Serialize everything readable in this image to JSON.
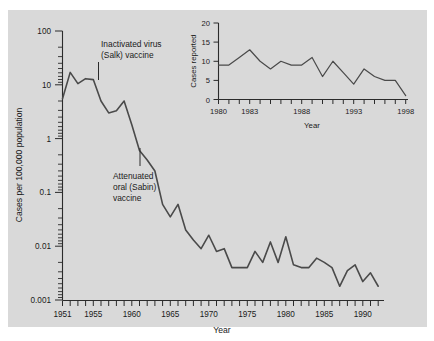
{
  "figure": {
    "background_color": "#ffffff",
    "panel_color": "#d9d9d9",
    "line_color": "#4a4a4a",
    "axis_color": "#2b2b2b"
  },
  "chart_data": {
    "type": "line",
    "title": "",
    "xlabel": "Year",
    "ylabel": "Cases per 100,000 population",
    "yscale": "log",
    "ylim": [
      0.001,
      100
    ],
    "xlim": [
      1951,
      1992
    ],
    "grid": false,
    "legend": "none",
    "ytick_labels": [
      "100",
      "10",
      "1",
      "0.1",
      "0.01",
      "0.001"
    ],
    "ytick_values": [
      100,
      10,
      1,
      0.1,
      0.01,
      0.001
    ],
    "xtick_labels": [
      "1951",
      "1955",
      "1960",
      "1965",
      "1970",
      "1975",
      "1980",
      "1985",
      "1990"
    ],
    "xtick_values": [
      1951,
      1955,
      1960,
      1965,
      1970,
      1975,
      1980,
      1985,
      1990
    ],
    "x": [
      1951,
      1952,
      1953,
      1954,
      1955,
      1956,
      1957,
      1958,
      1959,
      1960,
      1961,
      1962,
      1963,
      1964,
      1965,
      1966,
      1967,
      1968,
      1969,
      1970,
      1971,
      1972,
      1973,
      1974,
      1975,
      1976,
      1977,
      1978,
      1979,
      1980,
      1981,
      1982,
      1983,
      1984,
      1985,
      1986,
      1987,
      1988,
      1989,
      1990,
      1991,
      1992
    ],
    "values": [
      5.5,
      17.0,
      10.5,
      13.0,
      12.5,
      5.0,
      3.0,
      3.3,
      5.0,
      1.8,
      0.6,
      0.4,
      0.25,
      0.06,
      0.035,
      0.06,
      0.02,
      0.013,
      0.009,
      0.016,
      0.008,
      0.009,
      0.004,
      0.004,
      0.004,
      0.008,
      0.005,
      0.012,
      0.005,
      0.015,
      0.0045,
      0.004,
      0.004,
      0.006,
      0.005,
      0.004,
      0.0018,
      0.0035,
      0.0045,
      0.0022,
      0.0032,
      0.0018
    ],
    "annotations": [
      {
        "text_lines": [
          "Inactivated virus",
          "(Salk) vaccine"
        ],
        "year": 1955
      },
      {
        "text_lines": [
          "Attenuated",
          "oral (Sabin)",
          "vaccine"
        ],
        "year": 1961
      }
    ]
  },
  "inset_chart_data": {
    "type": "line",
    "title": "",
    "xlabel": "Year",
    "ylabel": "Cases reported",
    "yscale": "linear",
    "ylim": [
      0,
      20
    ],
    "xlim": [
      1980,
      1998
    ],
    "grid": false,
    "legend": "none",
    "ytick_labels": [
      "20",
      "15",
      "10",
      "5",
      "0"
    ],
    "ytick_values": [
      20,
      15,
      10,
      5,
      0
    ],
    "xtick_labels": [
      "1980",
      "1983",
      "1988",
      "1993",
      "1998"
    ],
    "xtick_values": [
      1980,
      1983,
      1988,
      1993,
      1998
    ],
    "x": [
      1980,
      1981,
      1982,
      1983,
      1984,
      1985,
      1986,
      1987,
      1988,
      1989,
      1990,
      1991,
      1992,
      1993,
      1994,
      1995,
      1996,
      1997,
      1998
    ],
    "values": [
      9,
      9,
      11,
      13,
      10,
      8,
      10,
      9,
      9,
      11,
      6,
      10,
      7,
      4,
      8,
      6,
      5,
      5,
      1
    ]
  },
  "labels": {
    "x_axis_title": "Year",
    "y_axis_title": "Cases per 100,000 population",
    "inset_x_axis_title": "Year",
    "inset_y_axis_title": "Cases reported",
    "annotation_1_line_1": "Inactivated virus",
    "annotation_1_line_2": "(Salk) vaccine",
    "annotation_2_line_1": "Attenuated",
    "annotation_2_line_2": "oral (Sabin)",
    "annotation_2_line_3": "vaccine",
    "y_100": "100",
    "y_10": "10",
    "y_1": "1",
    "y_01": "0.1",
    "y_001": "0.01",
    "y_0001": "0.001",
    "x_1951": "1951",
    "x_1955": "1955",
    "x_1960": "1960",
    "x_1965": "1965",
    "x_1970": "1970",
    "x_1975": "1975",
    "x_1980": "1980",
    "x_1985": "1985",
    "x_1990": "1990",
    "i_20": "20",
    "i_15": "15",
    "i_10": "10",
    "i_5": "5",
    "i_0": "0",
    "i_1980": "1980",
    "i_1983": "1983",
    "i_1988": "1988",
    "i_1993": "1993",
    "i_1998": "1998"
  }
}
